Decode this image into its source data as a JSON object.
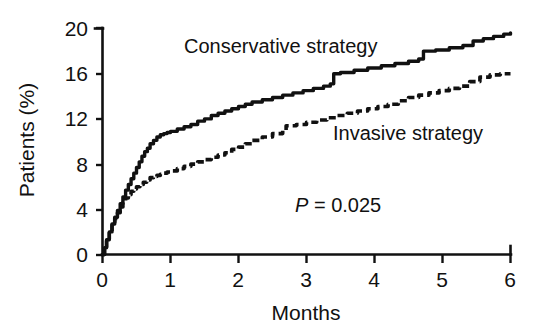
{
  "chart_data": {
    "type": "line",
    "title": "",
    "xlabel": "Months",
    "ylabel": "Patients (%)",
    "xlim": [
      0,
      6
    ],
    "ylim": [
      0,
      20
    ],
    "xticks": [
      "0",
      "1",
      "2",
      "3",
      "4",
      "5",
      "6"
    ],
    "yticks": [
      "0",
      "4",
      "8",
      "12",
      "16",
      "20"
    ],
    "grid": false,
    "legend_position": "inline-annotations",
    "annotations": [
      {
        "name": "p-value",
        "italic_prefix": "P",
        "rest": " = 0.025",
        "text": "P = 0.025",
        "x": 3.0,
        "y": 4.4
      },
      {
        "name": "conservative-label",
        "text": "Conservative strategy",
        "x": 2.1,
        "y": 19.6
      },
      {
        "name": "invasive-label",
        "text": "Invasive strategy",
        "x": 4.4,
        "y": 10.8
      }
    ],
    "series": [
      {
        "name": "Conservative strategy",
        "style": "solid",
        "color": "#111111",
        "final_value": 19.6,
        "points": [
          [
            0.0,
            0.0
          ],
          [
            0.03,
            0.6
          ],
          [
            0.06,
            1.3
          ],
          [
            0.1,
            2.0
          ],
          [
            0.14,
            2.7
          ],
          [
            0.18,
            3.3
          ],
          [
            0.22,
            3.9
          ],
          [
            0.26,
            4.5
          ],
          [
            0.3,
            5.1
          ],
          [
            0.34,
            5.7
          ],
          [
            0.38,
            6.2
          ],
          [
            0.42,
            6.7
          ],
          [
            0.46,
            7.2
          ],
          [
            0.5,
            7.7
          ],
          [
            0.54,
            8.2
          ],
          [
            0.58,
            8.7
          ],
          [
            0.62,
            9.1
          ],
          [
            0.66,
            9.4
          ],
          [
            0.7,
            9.8
          ],
          [
            0.75,
            10.1
          ],
          [
            0.8,
            10.4
          ],
          [
            0.85,
            10.6
          ],
          [
            0.9,
            10.7
          ],
          [
            0.95,
            10.8
          ],
          [
            1.0,
            10.9
          ],
          [
            1.1,
            11.1
          ],
          [
            1.2,
            11.3
          ],
          [
            1.3,
            11.5
          ],
          [
            1.4,
            11.8
          ],
          [
            1.5,
            12.0
          ],
          [
            1.6,
            12.3
          ],
          [
            1.7,
            12.5
          ],
          [
            1.8,
            12.7
          ],
          [
            1.9,
            12.9
          ],
          [
            2.0,
            13.1
          ],
          [
            2.1,
            13.3
          ],
          [
            2.2,
            13.5
          ],
          [
            2.35,
            13.7
          ],
          [
            2.5,
            13.9
          ],
          [
            2.65,
            14.1
          ],
          [
            2.8,
            14.3
          ],
          [
            2.95,
            14.5
          ],
          [
            3.1,
            14.7
          ],
          [
            3.25,
            14.9
          ],
          [
            3.35,
            15.1
          ],
          [
            3.4,
            16.0
          ],
          [
            3.5,
            16.1
          ],
          [
            3.7,
            16.3
          ],
          [
            3.9,
            16.5
          ],
          [
            4.1,
            16.7
          ],
          [
            4.3,
            16.9
          ],
          [
            4.5,
            17.1
          ],
          [
            4.65,
            17.3
          ],
          [
            4.72,
            18.0
          ],
          [
            4.9,
            18.1
          ],
          [
            5.1,
            18.3
          ],
          [
            5.3,
            18.5
          ],
          [
            5.45,
            18.9
          ],
          [
            5.6,
            19.1
          ],
          [
            5.75,
            19.3
          ],
          [
            5.9,
            19.5
          ],
          [
            6.0,
            19.6
          ]
        ]
      },
      {
        "name": "Invasive strategy",
        "style": "dashed",
        "color": "#111111",
        "final_value": 16.0,
        "points": [
          [
            0.0,
            0.0
          ],
          [
            0.03,
            0.6
          ],
          [
            0.06,
            1.3
          ],
          [
            0.1,
            2.0
          ],
          [
            0.14,
            2.6
          ],
          [
            0.18,
            3.2
          ],
          [
            0.22,
            3.7
          ],
          [
            0.26,
            4.2
          ],
          [
            0.3,
            4.6
          ],
          [
            0.34,
            5.0
          ],
          [
            0.38,
            5.3
          ],
          [
            0.42,
            5.6
          ],
          [
            0.46,
            5.8
          ],
          [
            0.5,
            6.0
          ],
          [
            0.55,
            6.2
          ],
          [
            0.6,
            6.4
          ],
          [
            0.65,
            6.6
          ],
          [
            0.7,
            6.8
          ],
          [
            0.75,
            6.9
          ],
          [
            0.8,
            7.0
          ],
          [
            0.85,
            7.1
          ],
          [
            0.9,
            7.2
          ],
          [
            0.95,
            7.3
          ],
          [
            1.0,
            7.4
          ],
          [
            1.1,
            7.6
          ],
          [
            1.2,
            7.8
          ],
          [
            1.3,
            8.0
          ],
          [
            1.4,
            8.2
          ],
          [
            1.5,
            8.4
          ],
          [
            1.6,
            8.6
          ],
          [
            1.7,
            8.8
          ],
          [
            1.8,
            9.0
          ],
          [
            1.9,
            9.3
          ],
          [
            2.0,
            9.5
          ],
          [
            2.1,
            9.8
          ],
          [
            2.2,
            10.1
          ],
          [
            2.35,
            10.4
          ],
          [
            2.5,
            10.7
          ],
          [
            2.65,
            11.0
          ],
          [
            2.7,
            11.4
          ],
          [
            2.85,
            11.5
          ],
          [
            3.0,
            11.7
          ],
          [
            3.15,
            11.9
          ],
          [
            3.3,
            12.1
          ],
          [
            3.45,
            12.3
          ],
          [
            3.6,
            12.5
          ],
          [
            3.75,
            12.7
          ],
          [
            3.9,
            12.9
          ],
          [
            4.05,
            13.1
          ],
          [
            4.2,
            13.3
          ],
          [
            4.35,
            13.6
          ],
          [
            4.5,
            13.9
          ],
          [
            4.65,
            14.1
          ],
          [
            4.8,
            14.3
          ],
          [
            4.95,
            14.5
          ],
          [
            5.1,
            14.7
          ],
          [
            5.25,
            14.9
          ],
          [
            5.4,
            15.3
          ],
          [
            5.55,
            15.7
          ],
          [
            5.7,
            15.9
          ],
          [
            5.85,
            16.0
          ],
          [
            6.0,
            16.0
          ]
        ]
      }
    ]
  },
  "axes": {
    "x_title": "Months",
    "y_title": "Patients (%)",
    "x_tick_labels": [
      "0",
      "1",
      "2",
      "3",
      "4",
      "5",
      "6"
    ],
    "y_tick_labels": [
      "0",
      "4",
      "8",
      "12",
      "16",
      "20"
    ]
  },
  "labels": {
    "conservative": "Conservative strategy",
    "invasive": "Invasive strategy",
    "p_value_prefix": "P",
    "p_value_rest": " = 0.025"
  },
  "colors": {
    "ink": "#111111",
    "background": "#ffffff"
  }
}
